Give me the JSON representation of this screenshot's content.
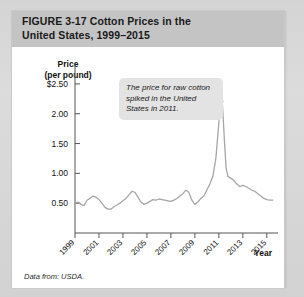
{
  "figure": {
    "number_label": "FIGURE  3-17",
    "title_line1": "Cotton Prices in the",
    "title_line2": "United States, 1999–2015",
    "source_note": "Data from: USDA."
  },
  "callout": {
    "text": "The price for raw cotton spiked in the United States in 2011."
  },
  "axes": {
    "y_title_line1": "Price",
    "y_title_line2": "(per pound)",
    "x_title": "Year"
  },
  "chart_data": {
    "type": "line",
    "title": "Cotton Prices in the United States, 1999–2015",
    "xlabel": "Year",
    "ylabel": "Price (per pound)",
    "xlim": [
      1999,
      2015.6
    ],
    "ylim": [
      0,
      2.75
    ],
    "ytick_labels": [
      "$2.50",
      "2.00",
      "1.50",
      "1.00",
      "0.50"
    ],
    "ytick_values": [
      2.5,
      2.0,
      1.5,
      1.0,
      0.5
    ],
    "xtick_labels": [
      "1999",
      "2001",
      "2003",
      "2005",
      "2007",
      "2009",
      "2011",
      "2013",
      "2015"
    ],
    "xtick_values": [
      1999,
      2001,
      2003,
      2005,
      2007,
      2009,
      2011,
      2013,
      2015
    ],
    "grid": false,
    "legend": false,
    "line_color": "#a6a6a6",
    "series": [
      {
        "name": "Cotton price (US$ per pound)",
        "x": [
          1999.0,
          1999.25,
          1999.5,
          1999.75,
          2000.0,
          2000.25,
          2000.5,
          2000.75,
          2001.0,
          2001.25,
          2001.5,
          2001.75,
          2002.0,
          2002.25,
          2002.5,
          2002.75,
          2003.0,
          2003.25,
          2003.5,
          2003.75,
          2004.0,
          2004.25,
          2004.5,
          2004.75,
          2005.0,
          2005.25,
          2005.5,
          2005.75,
          2006.0,
          2006.25,
          2006.5,
          2006.75,
          2007.0,
          2007.25,
          2007.5,
          2007.75,
          2008.0,
          2008.25,
          2008.5,
          2008.75,
          2009.0,
          2009.25,
          2009.5,
          2009.75,
          2010.0,
          2010.25,
          2010.5,
          2010.75,
          2011.0,
          2011.15,
          2011.3,
          2011.45,
          2011.6,
          2011.75,
          2012.0,
          2012.25,
          2012.5,
          2012.75,
          2013.0,
          2013.25,
          2013.5,
          2013.75,
          2014.0,
          2014.25,
          2014.5,
          2014.75,
          2015.0,
          2015.25,
          2015.5
        ],
        "values": [
          0.5,
          0.52,
          0.48,
          0.46,
          0.55,
          0.58,
          0.62,
          0.6,
          0.56,
          0.5,
          0.43,
          0.4,
          0.4,
          0.44,
          0.47,
          0.5,
          0.54,
          0.58,
          0.64,
          0.7,
          0.68,
          0.6,
          0.52,
          0.48,
          0.5,
          0.53,
          0.56,
          0.55,
          0.57,
          0.56,
          0.55,
          0.54,
          0.53,
          0.55,
          0.58,
          0.62,
          0.66,
          0.72,
          0.68,
          0.55,
          0.48,
          0.52,
          0.58,
          0.62,
          0.72,
          0.82,
          0.95,
          1.25,
          1.85,
          2.2,
          2.15,
          1.6,
          1.1,
          0.95,
          0.92,
          0.88,
          0.82,
          0.78,
          0.8,
          0.78,
          0.75,
          0.72,
          0.7,
          0.66,
          0.62,
          0.58,
          0.56,
          0.55,
          0.55
        ]
      }
    ],
    "annotations": [
      {
        "text": "The price for raw cotton spiked in the United States in 2011.",
        "points_to_x": 2011.15,
        "points_to_y": 2.25
      }
    ]
  }
}
